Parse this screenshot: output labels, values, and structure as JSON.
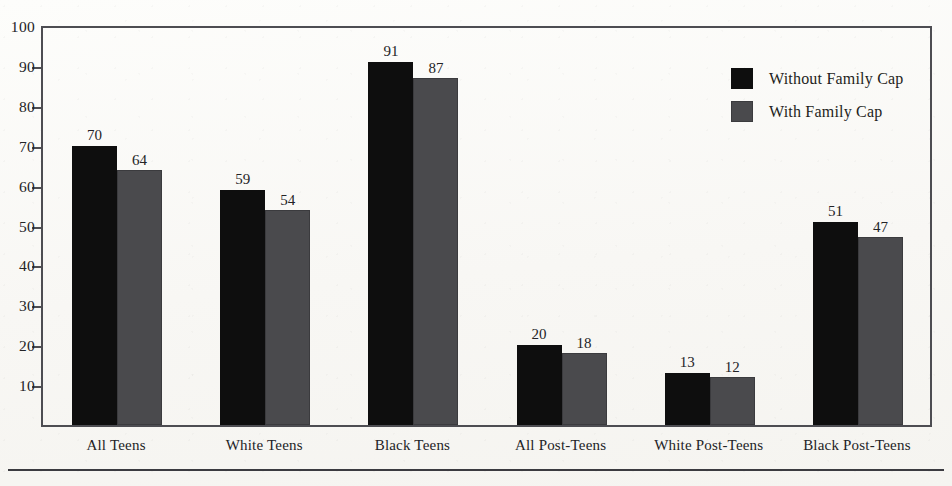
{
  "chart_data": {
    "type": "bar",
    "title": "",
    "subtitle": "",
    "xlabel": "",
    "ylabel": "",
    "ylim": [
      0,
      100
    ],
    "yticks": [
      10,
      20,
      30,
      40,
      50,
      60,
      70,
      80,
      90,
      100
    ],
    "ytick_labels": [
      "10",
      "20",
      "30",
      "40",
      "50",
      "60",
      "70",
      "80",
      "90",
      "100"
    ],
    "grid": false,
    "legend_position": "top-right-inside",
    "show_value_labels": true,
    "categories": [
      "All Teens",
      "White Teens",
      "Black Teens",
      "All Post-Teens",
      "White Post-Teens",
      "Black Post-Teens"
    ],
    "series": [
      {
        "name": "Without Family Cap",
        "color": "#0e0e0e",
        "values": [
          70,
          59,
          91,
          20,
          13,
          51
        ],
        "value_labels": [
          "70",
          "59",
          "91",
          "20",
          "13",
          "51"
        ]
      },
      {
        "name": "With Family Cap",
        "color": "#4a4a4d",
        "values": [
          64,
          54,
          87,
          18,
          12,
          47
        ],
        "value_labels": [
          "64",
          "54",
          "87",
          "18",
          "12",
          "47"
        ]
      }
    ]
  },
  "legend": {
    "items": [
      {
        "label": "Without Family Cap",
        "color": "#0e0e0e"
      },
      {
        "label": "With Family Cap",
        "color": "#4a4a4d"
      }
    ]
  },
  "axis": {
    "y_ticks": [
      {
        "label": "100",
        "value": 100
      },
      {
        "label": "90",
        "value": 90
      },
      {
        "label": "80",
        "value": 80
      },
      {
        "label": "70",
        "value": 70
      },
      {
        "label": "60",
        "value": 60
      },
      {
        "label": "50",
        "value": 50
      },
      {
        "label": "40",
        "value": 40
      },
      {
        "label": "30",
        "value": 30
      },
      {
        "label": "20",
        "value": 20
      },
      {
        "label": "10",
        "value": 10
      }
    ]
  },
  "colors": {
    "background": "#fbfaf8",
    "frame": "#4d4d52",
    "text": "#232326",
    "series_without_family_cap": "#0e0e0e",
    "series_with_family_cap": "#4a4a4d"
  }
}
